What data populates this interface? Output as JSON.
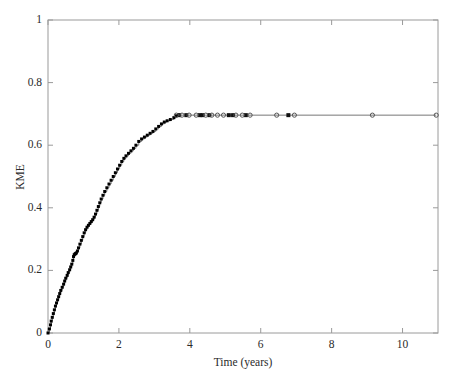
{
  "chart_data": {
    "type": "line",
    "title": "",
    "xlabel": "Time (years)",
    "ylabel": "KME",
    "xlim": [
      0,
      11.0
    ],
    "ylim": [
      0,
      1
    ],
    "xticks": [
      0,
      2,
      4,
      6,
      8,
      10
    ],
    "xtick_labels": [
      "0",
      "2",
      "4",
      "6",
      "8",
      "10"
    ],
    "yticks": [
      0,
      0.2,
      0.4,
      0.6,
      0.8,
      1
    ],
    "ytick_labels": [
      "0",
      "0.2",
      "0.4",
      "0.6",
      "0.8",
      "1"
    ],
    "grid": false,
    "legend": null,
    "series": [
      {
        "name": "Kaplan-Meier estimate",
        "style": "step",
        "color": "#000000",
        "marker": "square",
        "x": [
          0.0,
          0.04,
          0.07,
          0.09,
          0.12,
          0.15,
          0.18,
          0.21,
          0.24,
          0.27,
          0.3,
          0.33,
          0.36,
          0.4,
          0.44,
          0.47,
          0.5,
          0.54,
          0.57,
          0.61,
          0.64,
          0.67,
          0.7,
          0.72,
          0.74,
          0.76,
          0.78,
          0.8,
          0.83,
          0.86,
          0.9,
          0.94,
          0.98,
          1.02,
          1.06,
          1.1,
          1.14,
          1.18,
          1.22,
          1.26,
          1.3,
          1.34,
          1.38,
          1.42,
          1.46,
          1.5,
          1.55,
          1.6,
          1.66,
          1.72,
          1.78,
          1.84,
          1.9,
          1.96,
          2.02,
          2.08,
          2.14,
          2.2,
          2.27,
          2.34,
          2.41,
          2.48,
          2.56,
          2.64,
          2.72,
          2.8,
          2.88,
          2.96,
          3.04,
          3.12,
          3.2,
          3.28,
          3.36,
          3.45,
          3.55,
          3.62,
          3.7,
          10.95
        ],
        "y": [
          0.0,
          0.013,
          0.026,
          0.038,
          0.05,
          0.062,
          0.074,
          0.086,
          0.096,
          0.106,
          0.116,
          0.126,
          0.136,
          0.146,
          0.156,
          0.166,
          0.175,
          0.184,
          0.193,
          0.202,
          0.211,
          0.22,
          0.232,
          0.244,
          0.25,
          0.252,
          0.254,
          0.256,
          0.262,
          0.272,
          0.284,
          0.296,
          0.308,
          0.32,
          0.33,
          0.338,
          0.344,
          0.35,
          0.356,
          0.362,
          0.37,
          0.38,
          0.392,
          0.404,
          0.416,
          0.428,
          0.44,
          0.452,
          0.464,
          0.476,
          0.488,
          0.5,
          0.512,
          0.524,
          0.536,
          0.548,
          0.558,
          0.566,
          0.574,
          0.582,
          0.59,
          0.6,
          0.612,
          0.62,
          0.626,
          0.632,
          0.638,
          0.644,
          0.652,
          0.66,
          0.668,
          0.674,
          0.678,
          0.682,
          0.688,
          0.694,
          0.696,
          0.696
        ]
      }
    ],
    "censor_marks": {
      "name": "Censored observations",
      "marker": "circle-open",
      "color": "#555555",
      "x": [
        3.62,
        3.78,
        3.98,
        4.18,
        4.45,
        4.62,
        4.78,
        4.95,
        5.3,
        5.48,
        5.7,
        6.45,
        6.95,
        9.15,
        10.95
      ],
      "y": [
        0.696,
        0.696,
        0.696,
        0.696,
        0.696,
        0.696,
        0.696,
        0.696,
        0.696,
        0.696,
        0.696,
        0.696,
        0.696,
        0.696,
        0.696
      ]
    },
    "event_marks": {
      "name": "Event/observation markers on plateau",
      "marker": "square-filled",
      "color": "#111111",
      "x": [
        3.7,
        3.9,
        4.28,
        4.36,
        4.55,
        5.1,
        5.22,
        5.58,
        6.78
      ],
      "y": [
        0.696,
        0.696,
        0.696,
        0.696,
        0.696,
        0.696,
        0.696,
        0.696,
        0.696
      ]
    },
    "axis_color": "#9a9a9a",
    "plateau_value": 0.696
  }
}
